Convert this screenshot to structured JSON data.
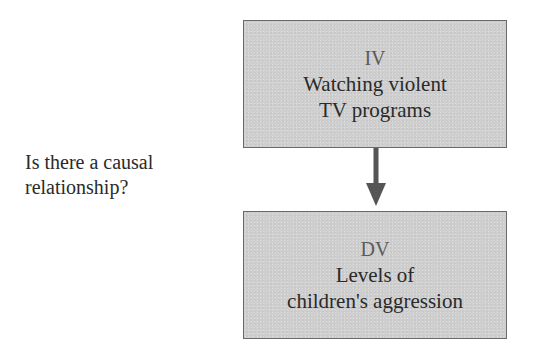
{
  "diagram": {
    "type": "causal-flow",
    "question": {
      "line1": "Is there a causal",
      "line2": "relationship?"
    },
    "nodes": [
      {
        "id": "iv",
        "tag": "IV",
        "line1": "Watching violent",
        "line2": "TV programs"
      },
      {
        "id": "dv",
        "tag": "DV",
        "line1": "Levels of",
        "line2": "children's aggression"
      }
    ],
    "edges": [
      {
        "from": "iv",
        "to": "dv",
        "style": "solid-arrow"
      }
    ],
    "colors": {
      "box_fill": "#cfcfcf",
      "box_border": "#6a6a6a",
      "arrow": "#555555",
      "text": "#2a2a2a",
      "tag_text": "#5a5a5a"
    }
  }
}
